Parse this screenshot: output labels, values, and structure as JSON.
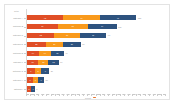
{
  "chart": {
    "top_header": "Total",
    "xlabel": "Count",
    "x_axis_marker_color": "#e8762d"
  },
  "colors": {
    "segment_1": "#e04e26",
    "segment_2": "#f99a1c",
    "segment_3": "#2e537f",
    "frame_border": "#e3e3e3",
    "axis_line": "#d8d8d8",
    "label_text": "#8d8d8d",
    "background": "#ffffff"
  },
  "chart_data": {
    "type": "bar",
    "orientation": "horizontal",
    "stacked": true,
    "title": "",
    "xlabel": "Count",
    "ylabel": "",
    "xlim": [
      0,
      150
    ],
    "grid": false,
    "legend": "none",
    "categories": [
      "Category A",
      "Category B",
      "Category C",
      "Category D",
      "Category E",
      "Category F",
      "Category G",
      "Category H",
      "Category I"
    ],
    "series": [
      {
        "name": "Series 1",
        "color": "#e04e26",
        "values": [
          42,
          36,
          32,
          22,
          14,
          13,
          9,
          7,
          5
        ]
      },
      {
        "name": "Series 2",
        "color": "#f99a1c",
        "values": [
          43,
          35,
          30,
          20,
          14,
          12,
          8,
          6,
          0
        ]
      },
      {
        "name": "Series 3",
        "color": "#2e537f",
        "values": [
          43,
          34,
          31,
          21,
          15,
          12,
          9,
          7,
          4
        ]
      }
    ],
    "totals": [
      128,
      105,
      93,
      63,
      43,
      37,
      26,
      20,
      9
    ]
  },
  "rows": [
    {
      "label": "Category A",
      "total": "128",
      "segments": [
        {
          "label": "42",
          "value": 42,
          "color": "#e04e26"
        },
        {
          "label": "43",
          "value": 43,
          "color": "#f99a1c"
        },
        {
          "label": "43",
          "value": 43,
          "color": "#2e537f"
        }
      ]
    },
    {
      "label": "Category B",
      "total": "105",
      "segments": [
        {
          "label": "36",
          "value": 36,
          "color": "#e04e26"
        },
        {
          "label": "35",
          "value": 35,
          "color": "#f99a1c"
        },
        {
          "label": "34",
          "value": 34,
          "color": "#2e537f"
        }
      ]
    },
    {
      "label": "Category C",
      "total": "93",
      "segments": [
        {
          "label": "32",
          "value": 32,
          "color": "#e04e26"
        },
        {
          "label": "30",
          "value": 30,
          "color": "#f99a1c"
        },
        {
          "label": "31",
          "value": 31,
          "color": "#2e537f"
        }
      ]
    },
    {
      "label": "Category D",
      "total": "63",
      "segments": [
        {
          "label": "22",
          "value": 22,
          "color": "#e04e26"
        },
        {
          "label": "20",
          "value": 20,
          "color": "#f99a1c"
        },
        {
          "label": "21",
          "value": 21,
          "color": "#2e537f"
        }
      ]
    },
    {
      "label": "Category E",
      "total": "43",
      "segments": [
        {
          "label": "14",
          "value": 14,
          "color": "#e04e26"
        },
        {
          "label": "14",
          "value": 14,
          "color": "#f99a1c"
        },
        {
          "label": "15",
          "value": 15,
          "color": "#2e537f"
        }
      ]
    },
    {
      "label": "Category F",
      "total": "37",
      "segments": [
        {
          "label": "13",
          "value": 13,
          "color": "#e04e26"
        },
        {
          "label": "12",
          "value": 12,
          "color": "#f99a1c"
        },
        {
          "label": "12",
          "value": 12,
          "color": "#2e537f"
        }
      ]
    },
    {
      "label": "Category G",
      "total": "26",
      "segments": [
        {
          "label": "9",
          "value": 9,
          "color": "#e04e26"
        },
        {
          "label": "8",
          "value": 8,
          "color": "#f99a1c"
        },
        {
          "label": "9",
          "value": 9,
          "color": "#2e537f"
        }
      ]
    },
    {
      "label": "Category H",
      "total": "20",
      "segments": [
        {
          "label": "7",
          "value": 7,
          "color": "#e04e26"
        },
        {
          "label": "6",
          "value": 6,
          "color": "#f99a1c"
        },
        {
          "label": "7",
          "value": 7,
          "color": "#2e537f"
        }
      ]
    },
    {
      "label": "Category I",
      "total": "9",
      "segments": [
        {
          "label": "5",
          "value": 5,
          "color": "#e04e26"
        },
        {
          "label": "4",
          "value": 4,
          "color": "#2e537f"
        }
      ]
    }
  ],
  "x_ticks": [
    "0",
    "20",
    "40",
    "60",
    "80",
    "100",
    "120",
    "140"
  ]
}
